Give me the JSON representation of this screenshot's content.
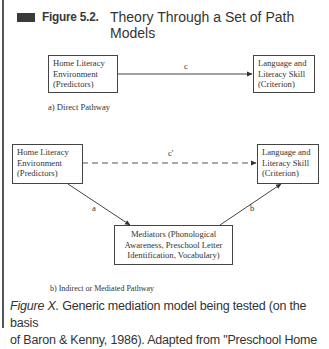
{
  "header": {
    "figure_number": "Figure 5.2.",
    "title_line1": "Theory Through a Set of Path",
    "title_line2": "Models"
  },
  "panel_a": {
    "predictor_box": [
      "Home Literacy",
      "Environment",
      "(Predictors)"
    ],
    "criterion_box": [
      "Language and",
      "Literacy Skill",
      "(Criterion)"
    ],
    "path_label": "c",
    "caption": "a) Direct Pathway"
  },
  "panel_b": {
    "predictor_box": [
      "Home Literacy",
      "Environment",
      "(Predictors)"
    ],
    "criterion_box": [
      "Language and",
      "Literacy Skill",
      "(Criterion)"
    ],
    "mediator_box": [
      "Mediators (Phonological",
      "Awareness, Preschool Letter",
      "Identification, Vocabulary)"
    ],
    "direct_path_label": "c'",
    "path_a_label": "a",
    "path_b_label": "b",
    "caption": "b) Indirect or Mediated Pathway"
  },
  "figure_caption": {
    "label": "Figure X.",
    "line1_rest": " Generic mediation model being tested (on the basis",
    "line2": "of Baron & Kenny, 1986). Adapted from \"Preschool Home"
  },
  "colors": {
    "rule": "#555555",
    "header_square": "#3a3a3a",
    "line": "#444444"
  }
}
